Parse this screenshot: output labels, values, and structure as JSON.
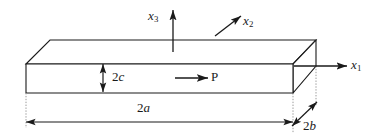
{
  "figure": {
    "background_color": "#ffffff",
    "line_color": "#1a1a1a",
    "guide_color": "#8a8a8a",
    "axes": [
      {
        "id": "x3",
        "base": "x",
        "subscript": "3",
        "direction": "up"
      },
      {
        "id": "x2",
        "base": "x",
        "subscript": "2",
        "direction": "up-right"
      },
      {
        "id": "x1",
        "base": "x",
        "subscript": "1",
        "direction": "right"
      }
    ],
    "dimensions": [
      {
        "id": "2c",
        "number": "2",
        "symbol": "c",
        "orientation": "vertical",
        "meaning": "thickness"
      },
      {
        "id": "2a",
        "number": "2",
        "symbol": "a",
        "orientation": "horizontal",
        "meaning": "length"
      },
      {
        "id": "2b",
        "number": "2",
        "symbol": "b",
        "orientation": "diagonal",
        "meaning": "width"
      }
    ],
    "load": {
      "id": "P",
      "label": "P",
      "direction": "right"
    }
  }
}
